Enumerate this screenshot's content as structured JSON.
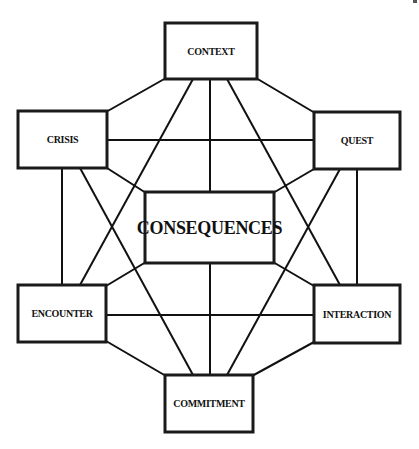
{
  "diagram": {
    "nodes": [
      {
        "id": "context",
        "label": "CONTEXT",
        "x": 165,
        "y": 23,
        "w": 92,
        "h": 56,
        "font_size": 10
      },
      {
        "id": "crisis",
        "label": "CRISIS",
        "x": 18,
        "y": 111,
        "w": 89,
        "h": 57,
        "font_size": 10
      },
      {
        "id": "quest",
        "label": "QUEST",
        "x": 314,
        "y": 112,
        "w": 86,
        "h": 57,
        "font_size": 10
      },
      {
        "id": "consequences",
        "label": "CONSEQUENCES",
        "x": 145,
        "y": 192,
        "w": 129,
        "h": 71,
        "font_size": 18
      },
      {
        "id": "encounter",
        "label": "ENCOUNTER",
        "x": 18,
        "y": 285,
        "w": 88,
        "h": 57,
        "font_size": 10
      },
      {
        "id": "interaction",
        "label": "INTERACTION",
        "x": 314,
        "y": 285,
        "w": 86,
        "h": 58,
        "font_size": 10
      },
      {
        "id": "commitment",
        "label": "COMMITMENT",
        "x": 165,
        "y": 375,
        "w": 88,
        "h": 57,
        "font_size": 10
      }
    ],
    "edges": [
      {
        "from": "context",
        "to": "crisis",
        "x1": 166,
        "y1": 78,
        "x2": 106,
        "y2": 112
      },
      {
        "from": "context",
        "to": "quest",
        "x1": 256,
        "y1": 78,
        "x2": 315,
        "y2": 113
      },
      {
        "from": "context",
        "to": "consequences",
        "x1": 210,
        "y1": 79,
        "x2": 210,
        "y2": 192
      },
      {
        "from": "context",
        "to": "encounter",
        "x1": 193,
        "y1": 79,
        "x2": 80,
        "y2": 285
      },
      {
        "from": "context",
        "to": "interaction",
        "x1": 227,
        "y1": 79,
        "x2": 340,
        "y2": 285
      },
      {
        "from": "crisis",
        "to": "quest",
        "x1": 107,
        "y1": 140,
        "x2": 314,
        "y2": 140
      },
      {
        "from": "crisis",
        "to": "encounter",
        "x1": 62,
        "y1": 168,
        "x2": 62,
        "y2": 285
      },
      {
        "from": "crisis",
        "to": "consequences",
        "x1": 107,
        "y1": 168,
        "x2": 146,
        "y2": 193
      },
      {
        "from": "crisis",
        "to": "commitment",
        "x1": 80,
        "y1": 168,
        "x2": 193,
        "y2": 375
      },
      {
        "from": "quest",
        "to": "interaction",
        "x1": 357,
        "y1": 169,
        "x2": 357,
        "y2": 285
      },
      {
        "from": "quest",
        "to": "consequences",
        "x1": 314,
        "y1": 169,
        "x2": 273,
        "y2": 193
      },
      {
        "from": "quest",
        "to": "commitment",
        "x1": 340,
        "y1": 169,
        "x2": 227,
        "y2": 375
      },
      {
        "from": "encounter",
        "to": "interaction",
        "x1": 106,
        "y1": 315,
        "x2": 314,
        "y2": 315
      },
      {
        "from": "encounter",
        "to": "consequences",
        "x1": 106,
        "y1": 286,
        "x2": 146,
        "y2": 262
      },
      {
        "from": "encounter",
        "to": "commitment",
        "x1": 106,
        "y1": 341,
        "x2": 166,
        "y2": 376
      },
      {
        "from": "interaction",
        "to": "consequences",
        "x1": 314,
        "y1": 286,
        "x2": 273,
        "y2": 262
      },
      {
        "from": "interaction",
        "to": "commitment",
        "x1": 314,
        "y1": 342,
        "x2": 252,
        "y2": 376
      },
      {
        "from": "consequences",
        "to": "commitment",
        "x1": 210,
        "y1": 263,
        "x2": 210,
        "y2": 375
      }
    ],
    "colors": {
      "stroke": "#111111",
      "box_border": "#1a1a1a",
      "background": "#ffffff"
    }
  }
}
